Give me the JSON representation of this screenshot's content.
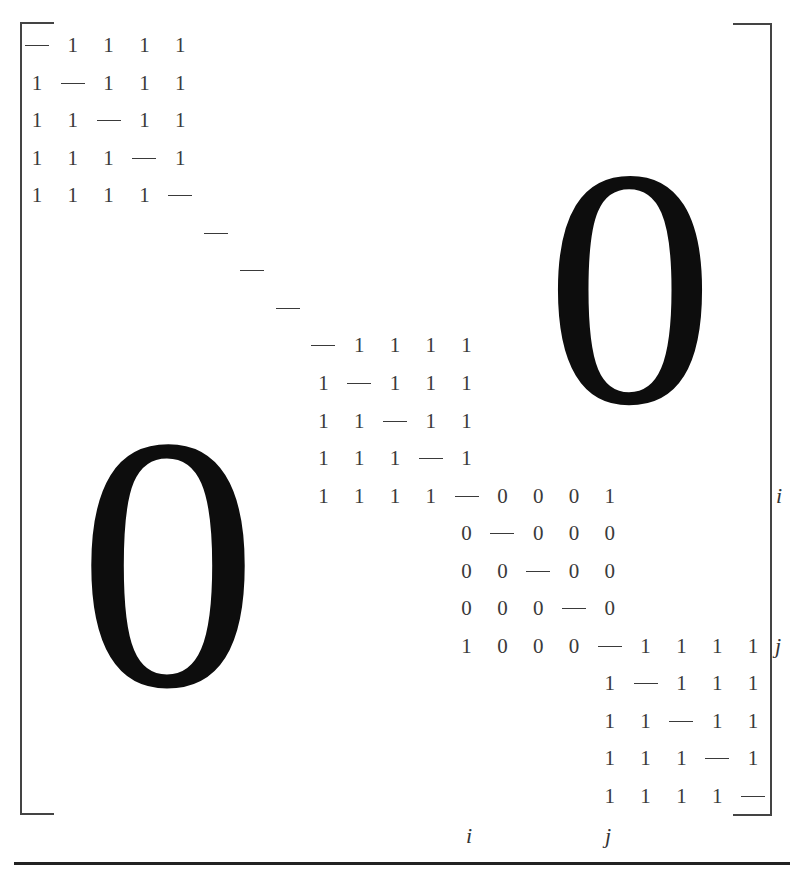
{
  "figure": {
    "big_zero_upper_right": "0",
    "big_zero_lower_left": "0",
    "diagonal_symbol": "—",
    "row_labels": {
      "i": "i",
      "j": "j"
    },
    "col_labels": {
      "i": "i",
      "j": "j"
    },
    "matrix_rows": [
      {
        "row": 0,
        "start_col": 0,
        "cells": [
          "—",
          "1",
          "1",
          "1",
          "1"
        ]
      },
      {
        "row": 1,
        "start_col": 0,
        "cells": [
          "1",
          "—",
          "1",
          "1",
          "1"
        ]
      },
      {
        "row": 2,
        "start_col": 0,
        "cells": [
          "1",
          "1",
          "—",
          "1",
          "1"
        ]
      },
      {
        "row": 3,
        "start_col": 0,
        "cells": [
          "1",
          "1",
          "1",
          "—",
          "1"
        ]
      },
      {
        "row": 4,
        "start_col": 0,
        "cells": [
          "1",
          "1",
          "1",
          "1",
          "—"
        ]
      },
      {
        "row": 5,
        "start_col": 5,
        "cells": [
          "—"
        ]
      },
      {
        "row": 6,
        "start_col": 6,
        "cells": [
          "—"
        ]
      },
      {
        "row": 7,
        "start_col": 7,
        "cells": [
          "—"
        ]
      },
      {
        "row": 8,
        "start_col": 8,
        "cells": [
          "—",
          "1",
          "1",
          "1",
          "1"
        ]
      },
      {
        "row": 9,
        "start_col": 8,
        "cells": [
          "1",
          "—",
          "1",
          "1",
          "1"
        ]
      },
      {
        "row": 10,
        "start_col": 8,
        "cells": [
          "1",
          "1",
          "—",
          "1",
          "1"
        ]
      },
      {
        "row": 11,
        "start_col": 8,
        "cells": [
          "1",
          "1",
          "1",
          "—",
          "1"
        ]
      },
      {
        "row": 12,
        "start_col": 8,
        "cells": [
          "1",
          "1",
          "1",
          "1",
          "—",
          "0",
          "0",
          "0",
          "1"
        ]
      },
      {
        "row": 13,
        "start_col": 12,
        "cells": [
          "0",
          "—",
          "0",
          "0",
          "0"
        ]
      },
      {
        "row": 14,
        "start_col": 12,
        "cells": [
          "0",
          "0",
          "—",
          "0",
          "0"
        ]
      },
      {
        "row": 15,
        "start_col": 12,
        "cells": [
          "0",
          "0",
          "0",
          "—",
          "0"
        ]
      },
      {
        "row": 16,
        "start_col": 12,
        "cells": [
          "1",
          "0",
          "0",
          "0",
          "—",
          "1",
          "1",
          "1",
          "1"
        ]
      },
      {
        "row": 17,
        "start_col": 16,
        "cells": [
          "1",
          "—",
          "1",
          "1",
          "1"
        ]
      },
      {
        "row": 18,
        "start_col": 16,
        "cells": [
          "1",
          "1",
          "—",
          "1",
          "1"
        ]
      },
      {
        "row": 19,
        "start_col": 16,
        "cells": [
          "1",
          "1",
          "1",
          "—",
          "1"
        ]
      },
      {
        "row": 20,
        "start_col": 16,
        "cells": [
          "1",
          "1",
          "1",
          "1",
          "—"
        ]
      }
    ]
  }
}
